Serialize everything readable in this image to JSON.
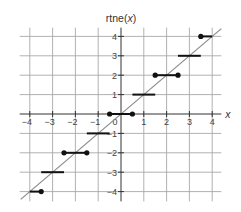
{
  "chart_data": {
    "type": "line",
    "title": "rtne(x)",
    "title_parts": {
      "prefix": "rtne(",
      "var": "x",
      "suffix": ")"
    },
    "xlabel": "x",
    "ylabel": "rtne(x)",
    "xlim": [
      -4.4,
      4.4
    ],
    "ylim": [
      -4.4,
      4.4
    ],
    "grid": true,
    "legend": "none",
    "x_ticks": [
      -4,
      -3,
      -2,
      -1,
      0,
      1,
      2,
      3,
      4
    ],
    "x_tick_labels": [
      "−4",
      "−3",
      "−2",
      "−1",
      "0",
      "1",
      "2",
      "3",
      "4"
    ],
    "y_ticks": [
      -4,
      -3,
      -2,
      -1,
      1,
      2,
      3,
      4
    ],
    "y_tick_labels": [
      "−4",
      "−3",
      "−2",
      "−1",
      "1",
      "2",
      "3",
      "4"
    ],
    "series": [
      {
        "name": "identity y = x",
        "kind": "line",
        "color": "#8a8a8a",
        "points": [
          [
            -4.4,
            -4.4
          ],
          [
            4.4,
            4.4
          ]
        ]
      },
      {
        "name": "rtne(x) round-to-nearest-even steps",
        "kind": "step-segments",
        "color": "#111111",
        "segments": [
          {
            "x0": -4.0,
            "x1": -3.5,
            "y": -4,
            "closed_left": false,
            "closed_right": true
          },
          {
            "x0": -3.5,
            "x1": -2.5,
            "y": -3,
            "closed_left": false,
            "closed_right": false
          },
          {
            "x0": -2.5,
            "x1": -1.5,
            "y": -2,
            "closed_left": true,
            "closed_right": true
          },
          {
            "x0": -1.5,
            "x1": -0.5,
            "y": -1,
            "closed_left": false,
            "closed_right": false
          },
          {
            "x0": -0.5,
            "x1": 0.5,
            "y": 0,
            "closed_left": true,
            "closed_right": true
          },
          {
            "x0": 0.5,
            "x1": 1.5,
            "y": 1,
            "closed_left": false,
            "closed_right": false
          },
          {
            "x0": 1.5,
            "x1": 2.5,
            "y": 2,
            "closed_left": true,
            "closed_right": true
          },
          {
            "x0": 2.5,
            "x1": 3.5,
            "y": 3,
            "closed_left": false,
            "closed_right": false
          },
          {
            "x0": 3.5,
            "x1": 4.0,
            "y": 4,
            "closed_left": true,
            "closed_right": false
          }
        ]
      }
    ]
  }
}
